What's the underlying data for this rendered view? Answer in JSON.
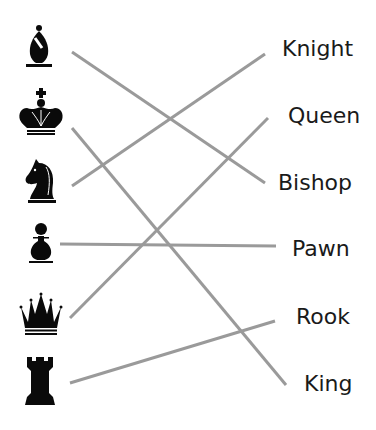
{
  "line_color": "#9a9a9a",
  "piece_color": "#0a0a0a",
  "pieces": [
    {
      "icon": "bishop-icon",
      "name": "bishop",
      "y": 48
    },
    {
      "icon": "king-icon",
      "name": "king",
      "y": 117
    },
    {
      "icon": "knight-icon",
      "name": "knight",
      "y": 184
    },
    {
      "icon": "pawn-icon",
      "name": "pawn",
      "y": 243
    },
    {
      "icon": "queen-icon",
      "name": "queen",
      "y": 315
    },
    {
      "icon": "rook-icon",
      "name": "rook",
      "y": 380
    }
  ],
  "labels": [
    {
      "text": "Knight",
      "x": 282,
      "y": 50
    },
    {
      "text": "Queen",
      "x": 288,
      "y": 117
    },
    {
      "text": "Bishop",
      "x": 278,
      "y": 183
    },
    {
      "text": "Pawn",
      "x": 292,
      "y": 250
    },
    {
      "text": "Rook",
      "x": 296,
      "y": 318
    },
    {
      "text": "King",
      "x": 304,
      "y": 385
    }
  ],
  "connections": [
    {
      "from": "bishop",
      "to": "Bishop",
      "x1": 72,
      "y1": 52,
      "x2": 265,
      "y2": 183
    },
    {
      "from": "king",
      "to": "King",
      "x1": 72,
      "y1": 128,
      "x2": 286,
      "y2": 385
    },
    {
      "from": "knight",
      "to": "Knight",
      "x1": 72,
      "y1": 186,
      "x2": 265,
      "y2": 54
    },
    {
      "from": "pawn",
      "to": "Pawn",
      "x1": 60,
      "y1": 244,
      "x2": 276,
      "y2": 246
    },
    {
      "from": "queen",
      "to": "Queen",
      "x1": 70,
      "y1": 318,
      "x2": 268,
      "y2": 118
    },
    {
      "from": "rook",
      "to": "Rook",
      "x1": 70,
      "y1": 383,
      "x2": 275,
      "y2": 321
    }
  ]
}
